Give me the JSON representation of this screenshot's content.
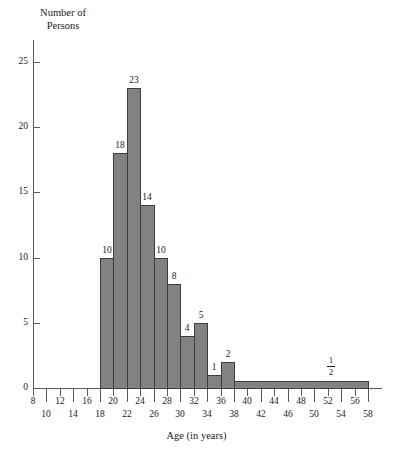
{
  "chart_data": {
    "type": "bar",
    "title": "",
    "xlabel": "Age (in years)",
    "ylabel": "Number of\nPersons",
    "xlim": [
      8,
      58
    ],
    "ylim": [
      0,
      26
    ],
    "grid": false,
    "legend": null,
    "bin_width": 2,
    "x_ticks": [
      8,
      10,
      12,
      14,
      16,
      18,
      20,
      22,
      24,
      26,
      28,
      30,
      32,
      34,
      36,
      38,
      40,
      42,
      44,
      46,
      48,
      50,
      52,
      54,
      56,
      58
    ],
    "x_tick_labels_top": [
      "8",
      "12",
      "16",
      "20",
      "24",
      "28",
      "32",
      "36",
      "40",
      "44",
      "48",
      "52",
      "56"
    ],
    "x_tick_labels_bottom": [
      "10",
      "14",
      "18",
      "22",
      "26",
      "30",
      "34",
      "38",
      "42",
      "46",
      "50",
      "54",
      "58"
    ],
    "y_ticks": [
      0,
      5,
      10,
      15,
      20,
      25
    ],
    "y_tick_labels": [
      "0",
      "5",
      "10",
      "15",
      "20",
      "25"
    ],
    "bins": [
      {
        "x0": 18,
        "x1": 20,
        "value": 10,
        "label": "10"
      },
      {
        "x0": 20,
        "x1": 22,
        "value": 18,
        "label": "18"
      },
      {
        "x0": 22,
        "x1": 24,
        "value": 23,
        "label": "23"
      },
      {
        "x0": 24,
        "x1": 26,
        "value": 14,
        "label": "14"
      },
      {
        "x0": 26,
        "x1": 28,
        "value": 10,
        "label": "10"
      },
      {
        "x0": 28,
        "x1": 30,
        "value": 8,
        "label": "8"
      },
      {
        "x0": 30,
        "x1": 32,
        "value": 4,
        "label": "4"
      },
      {
        "x0": 32,
        "x1": 34,
        "value": 5,
        "label": "5"
      },
      {
        "x0": 34,
        "x1": 36,
        "value": 1,
        "label": "1"
      },
      {
        "x0": 36,
        "x1": 38,
        "value": 2,
        "label": "2"
      },
      {
        "x0": 38,
        "x1": 58,
        "value": 0.5,
        "label": "1/2",
        "label_numerator": "1",
        "label_denominator": "2"
      }
    ],
    "colors": {
      "bar_fill": "#828282",
      "bar_edge": "#3d3d3d",
      "axis": "#5a5a5a",
      "text": "#1a1a1a",
      "background": "#ffffff"
    }
  }
}
